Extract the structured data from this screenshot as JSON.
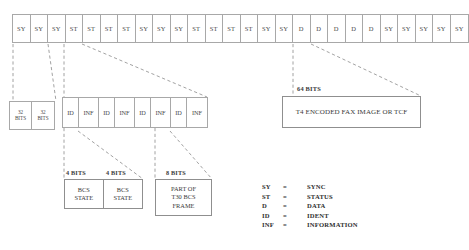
{
  "diagram": {
    "colors": {
      "line": "#a8a8a8",
      "box_border": "#8f8f8f",
      "text": "#3a3a3a",
      "background": "#ffffff"
    },
    "frame_row": {
      "name": "top-frame-sequence",
      "cells": [
        "SY",
        "SY",
        "SY",
        "ST",
        "ST",
        "ST",
        "ST",
        "SY",
        "SY",
        "SY",
        "ST",
        "ST",
        "ST",
        "ST",
        "SY",
        "SY",
        "D",
        "D",
        "D",
        "D",
        "D",
        "SY",
        "SY",
        "SY",
        "SY",
        "SY"
      ]
    },
    "sync_detail": {
      "name": "sync-32bit-boxes",
      "boxes": [
        {
          "line1": "32",
          "line2": "BITS"
        },
        {
          "line1": "32",
          "line2": "BITS"
        }
      ]
    },
    "status_detail": {
      "name": "status-id-inf-row",
      "cells": [
        {
          "label": "ID",
          "type": "id"
        },
        {
          "label": "INF",
          "type": "inf"
        },
        {
          "label": "ID",
          "type": "id"
        },
        {
          "label": "INF",
          "type": "inf"
        },
        {
          "label": "ID",
          "type": "id"
        },
        {
          "label": "INF",
          "type": "inf"
        },
        {
          "label": "ID",
          "type": "id"
        },
        {
          "label": "INF",
          "type": "inf"
        }
      ]
    },
    "data_detail": {
      "name": "data-64bit-box",
      "bits_label": "64 BITS",
      "box_text": "T4 ENCODED FAX IMAGE OR TCF"
    },
    "field_details": {
      "bcs": {
        "bits_label_left": "4 BITS",
        "bits_label_right": "4 BITS",
        "left": {
          "line1": "BCS",
          "line2": "STATE"
        },
        "right": {
          "line1": "BCS",
          "line2": "STATE"
        }
      },
      "t30": {
        "bits_label": "8 BITS",
        "line1": "PART OF",
        "line2": "T30 BCS",
        "line3": "FRAME"
      }
    },
    "legend": {
      "name": "abbreviation-legend",
      "separator": "=",
      "rows": [
        {
          "abbr": "SY",
          "full": "SYNC"
        },
        {
          "abbr": "ST",
          "full": "STATUS"
        },
        {
          "abbr": "D",
          "full": "DATA"
        },
        {
          "abbr": "ID",
          "full": "IDENT"
        },
        {
          "abbr": "INF",
          "full": "INFORMATION"
        }
      ]
    }
  }
}
